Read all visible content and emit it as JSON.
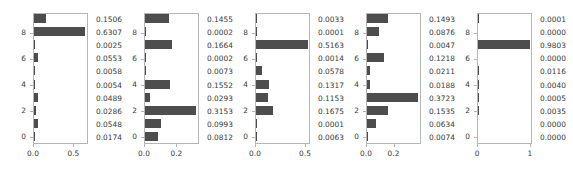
{
  "figure": {
    "background": "#ffffff",
    "bar_color": "#4d4d4d",
    "axis_color": "#b5b5b5",
    "text_color": "#3a3a3a",
    "panel_count": 5
  },
  "chart_data": [
    {
      "type": "bar",
      "orientation": "horizontal",
      "title": "",
      "xlabel": "",
      "ylabel": "",
      "xlim": [
        0,
        0.68
      ],
      "xticks": [
        0.0,
        0.5
      ],
      "xticklabels": [
        "0.0",
        "0.5"
      ],
      "yticks": [
        0,
        2,
        4,
        6,
        8
      ],
      "yticklabels": [
        "0",
        "2",
        "4",
        "6",
        "8"
      ],
      "categories": [
        "0",
        "1",
        "2",
        "3",
        "4",
        "5",
        "6",
        "7",
        "8",
        "9"
      ],
      "values": [
        0.0174,
        0.0548,
        0.0286,
        0.0489,
        0.0054,
        0.0058,
        0.0553,
        0.0025,
        0.6307,
        0.1506
      ],
      "value_labels_top_to_bottom": [
        "0.1506",
        "0.6307",
        "0.0025",
        "0.0553",
        "0.0058",
        "0.0054",
        "0.0489",
        "0.0286",
        "0.0548",
        "0.0174"
      ],
      "grid": false,
      "legend": null
    },
    {
      "type": "bar",
      "orientation": "horizontal",
      "title": "",
      "xlabel": "",
      "ylabel": "",
      "xlim": [
        0,
        0.34
      ],
      "xticks": [
        0.0,
        0.2
      ],
      "xticklabels": [
        "0.0",
        "0.2"
      ],
      "yticks": [
        0,
        2,
        4,
        6,
        8
      ],
      "yticklabels": [
        "0",
        "2",
        "4",
        "6",
        "8"
      ],
      "categories": [
        "0",
        "1",
        "2",
        "3",
        "4",
        "5",
        "6",
        "7",
        "8",
        "9"
      ],
      "values": [
        0.0812,
        0.0993,
        0.3153,
        0.0293,
        0.1552,
        0.0073,
        0.0002,
        0.1664,
        0.0002,
        0.1455
      ],
      "value_labels_top_to_bottom": [
        "0.1455",
        "0.0002",
        "0.1664",
        "0.0002",
        "0.0073",
        "0.1552",
        "0.0293",
        "0.3153",
        "0.0993",
        "0.0812"
      ],
      "grid": false,
      "legend": null
    },
    {
      "type": "bar",
      "orientation": "horizontal",
      "title": "",
      "xlabel": "",
      "ylabel": "",
      "xlim": [
        0,
        0.55
      ],
      "xticks": [
        0.0,
        0.5
      ],
      "xticklabels": [
        "0.0",
        "0.5"
      ],
      "yticks": [
        0,
        2,
        4,
        6,
        8
      ],
      "yticklabels": [
        "0",
        "2",
        "4",
        "6",
        "8"
      ],
      "categories": [
        "0",
        "1",
        "2",
        "3",
        "4",
        "5",
        "6",
        "7",
        "8",
        "9"
      ],
      "values": [
        0.0063,
        0.0001,
        0.1675,
        0.1153,
        0.1317,
        0.0578,
        0.0014,
        0.5163,
        0.0001,
        0.0033
      ],
      "value_labels_top_to_bottom": [
        "0.0033",
        "0.0001",
        "0.5163",
        "0.0014",
        "0.0578",
        "0.1317",
        "0.1153",
        "0.1675",
        "0.0001",
        "0.0063"
      ],
      "grid": false,
      "legend": null
    },
    {
      "type": "bar",
      "orientation": "horizontal",
      "title": "",
      "xlabel": "",
      "ylabel": "",
      "xlim": [
        0,
        0.4
      ],
      "xticks": [
        0.0,
        0.2
      ],
      "xticklabels": [
        "0.0",
        "0.2"
      ],
      "yticks": [
        0,
        2,
        4,
        6,
        8
      ],
      "yticklabels": [
        "0",
        "2",
        "4",
        "6",
        "8"
      ],
      "categories": [
        "0",
        "1",
        "2",
        "3",
        "4",
        "5",
        "6",
        "7",
        "8",
        "9"
      ],
      "values": [
        0.0074,
        0.0634,
        0.1535,
        0.3723,
        0.0188,
        0.0211,
        0.1218,
        0.0047,
        0.0876,
        0.1493
      ],
      "value_labels_top_to_bottom": [
        "0.1493",
        "0.0876",
        "0.0047",
        "0.1218",
        "0.0211",
        "0.0188",
        "0.3723",
        "0.1535",
        "0.0634",
        "0.0074"
      ],
      "grid": false,
      "legend": null
    },
    {
      "type": "bar",
      "orientation": "horizontal",
      "title": "",
      "xlabel": "",
      "ylabel": "",
      "xlim": [
        0,
        1.04
      ],
      "xticks": [
        0,
        1
      ],
      "xticklabels": [
        "0",
        "1"
      ],
      "yticks": [
        0,
        2,
        4,
        6,
        8
      ],
      "yticklabels": [
        "0",
        "2",
        "4",
        "6",
        "8"
      ],
      "categories": [
        "0",
        "1",
        "2",
        "3",
        "4",
        "5",
        "6",
        "7",
        "8",
        "9"
      ],
      "values": [
        0.0,
        0.0,
        0.0035,
        0.0005,
        0.004,
        0.0116,
        0.0,
        0.9803,
        0.0,
        0.0001
      ],
      "value_labels_top_to_bottom": [
        "0.0001",
        "0.0000",
        "0.9803",
        "0.0000",
        "0.0116",
        "0.0040",
        "0.0005",
        "0.0035",
        "0.0000",
        "0.0000"
      ],
      "grid": false,
      "legend": null
    }
  ],
  "panel_geometry": [
    {
      "left": 33,
      "plot_width": 55,
      "value_col_left": 96
    },
    {
      "left": 144,
      "plot_width": 55,
      "value_col_left": 207
    },
    {
      "left": 255,
      "plot_width": 55,
      "value_col_left": 318
    },
    {
      "left": 366,
      "plot_width": 55,
      "value_col_left": 429
    },
    {
      "left": 477,
      "plot_width": 55,
      "value_col_left": 540
    }
  ]
}
